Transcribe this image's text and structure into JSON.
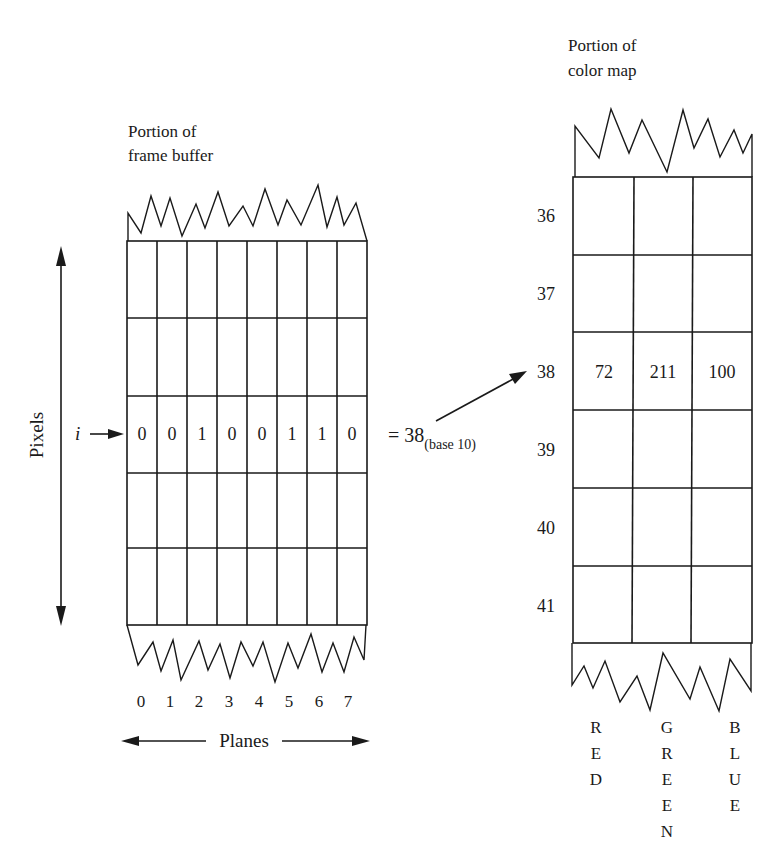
{
  "frame_buffer": {
    "title_line1": "Portion of",
    "title_line2": "frame buffer",
    "pixel_row_label": "i",
    "bits": [
      "0",
      "0",
      "1",
      "0",
      "0",
      "1",
      "1",
      "0"
    ],
    "plane_numbers": [
      "0",
      "1",
      "2",
      "3",
      "4",
      "5",
      "6",
      "7"
    ],
    "planes_label": "Planes",
    "pixels_label": "Pixels",
    "result_prefix": "= 38",
    "result_subscript": "(base 10)"
  },
  "color_map": {
    "title_line1": "Portion of",
    "title_line2": "color map",
    "row_indices": [
      "36",
      "37",
      "38",
      "39",
      "40",
      "41"
    ],
    "highlight_row": {
      "index": "38",
      "red": "72",
      "green": "211",
      "blue": "100"
    },
    "column_labels": {
      "red": [
        "R",
        "E",
        "D"
      ],
      "green": [
        "G",
        "R",
        "E",
        "E",
        "N"
      ],
      "blue": [
        "B",
        "L",
        "U",
        "E"
      ]
    }
  }
}
